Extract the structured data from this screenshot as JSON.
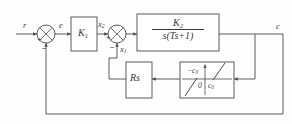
{
  "figure": {
    "type": "control-system-block-diagram",
    "background_color": "#fefefe",
    "line_color": "#4a4a4a",
    "text_color": "#3a3a3a"
  },
  "signals": {
    "reference_input": "r",
    "error": "e",
    "inner_forward": "x",
    "inner_forward_sub": "2",
    "inner_feedback": "x",
    "inner_feedback_sub": "1",
    "output": "c"
  },
  "summing_junctions": [
    {
      "id": "sum-1",
      "input_left_sign": "+",
      "input_bottom_sign": "−",
      "input_label": "r",
      "output_label": "e"
    },
    {
      "id": "sum-2",
      "input_left_sign": "+",
      "input_bottom_sign": "−",
      "input_label": "x2",
      "feedback_label": "x1"
    }
  ],
  "blocks": [
    {
      "id": "gain-block",
      "label": "K",
      "subscript": "1",
      "kind": "gain"
    },
    {
      "id": "plant-block",
      "numerator": "K",
      "numerator_sub": "2",
      "denominator": "s(Ts+1)",
      "kind": "transfer-function"
    },
    {
      "id": "rate-feedback-block",
      "label": "Rs",
      "kind": "rate-feedback-gain"
    },
    {
      "id": "nonlinearity-block",
      "kind": "dead-zone-nonlinearity",
      "label_upper": "−c",
      "label_upper_sub": "0",
      "label_origin": "0",
      "label_lower": "c",
      "label_lower_sub": "0"
    }
  ],
  "annotations": {
    "sum1_plus": "+",
    "sum1_minus": "−",
    "sum2_plus": "+",
    "sum2_minus": "−"
  }
}
